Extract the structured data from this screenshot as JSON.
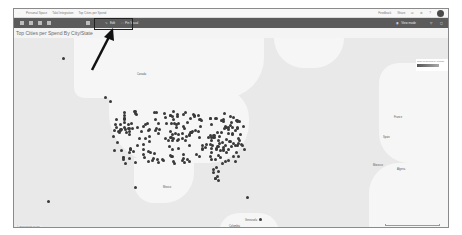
{
  "app": {
    "breadcrumb": [
      "Personal Space",
      "Talal Integration",
      "Top Cities per Spend"
    ],
    "top_right_actions": [
      "Feedback",
      "Share",
      "Notifications",
      "Settings",
      "Help",
      "Account"
    ]
  },
  "toolbar": {
    "items": [
      {
        "label": "Edit",
        "icon": "pencil-icon"
      },
      {
        "label": "Pin Visual",
        "icon": "pin-icon"
      }
    ],
    "right_items": [
      {
        "label": "View mode",
        "icon": "eye-icon"
      },
      {
        "label": "",
        "icon": "filter-icon"
      },
      {
        "label": "",
        "icon": "expand-icon"
      }
    ]
  },
  "visual": {
    "title": "Top Cities per Spend By City/State",
    "legend_title": "Sum of Spend by Month",
    "attribution": "© Bing  Terms of Use"
  },
  "map": {
    "labels": [
      {
        "text": "Canada",
        "x": 136,
        "y": 66
      },
      {
        "text": "Mexico",
        "x": 162,
        "y": 180
      },
      {
        "text": "Spain",
        "x": 382,
        "y": 130
      },
      {
        "text": "France",
        "x": 393,
        "y": 110
      },
      {
        "text": "Algeria",
        "x": 396,
        "y": 162
      },
      {
        "text": "Venezuela",
        "x": 244,
        "y": 214
      },
      {
        "text": "Colombia",
        "x": 228,
        "y": 220
      },
      {
        "text": "Morocco",
        "x": 372,
        "y": 158
      }
    ]
  },
  "colors": {
    "toolbar_bg": "#5b5b5b",
    "dot_color": "#3a3a3a",
    "map_water": "#e9e9e9",
    "map_land": "#f6f6f6"
  }
}
